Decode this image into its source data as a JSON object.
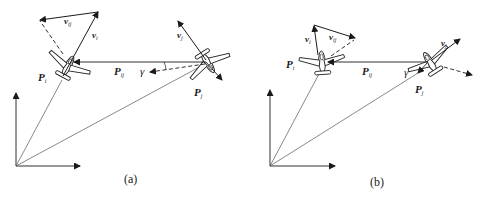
{
  "figure": {
    "panels": [
      {
        "id": "a",
        "caption": "(a)",
        "labels": {
          "v_i": "v",
          "v_i_sub": "i",
          "v_ij": "v",
          "v_ij_sub": "ij",
          "v_j": "v",
          "v_j_sub": "j",
          "P_i": "P",
          "P_i_sub": "i",
          "P_j": "P",
          "P_j_sub": "j",
          "P_ij": "P",
          "P_ij_sub": "ij",
          "gamma": "γ"
        }
      },
      {
        "id": "b",
        "caption": "(b)",
        "labels": {
          "v_i": "v",
          "v_i_sub": "i",
          "v_ij": "v",
          "v_ij_sub": "ij",
          "v_j": "v",
          "v_j_sub": "j",
          "P_i": "P",
          "P_i_sub": "i",
          "P_j": "P",
          "P_j_sub": "j",
          "P_ij": "P",
          "P_ij_sub": "ij",
          "gamma": "γ"
        }
      }
    ],
    "colors": {
      "line": "#1a1a1a",
      "thin_line": "#555555",
      "aircraft_fill": "#ffffff"
    }
  }
}
